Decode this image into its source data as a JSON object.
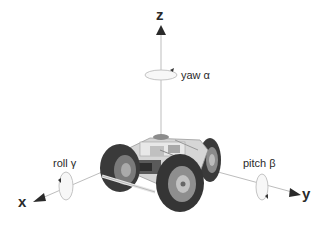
{
  "diagram": {
    "axes": {
      "z": {
        "label": "z"
      },
      "x": {
        "label": "x"
      },
      "y": {
        "label": "y"
      }
    },
    "rotations": {
      "yaw": {
        "label": "yaw α",
        "axis": "z"
      },
      "roll": {
        "label": "roll γ",
        "axis": "x"
      },
      "pitch": {
        "label": "pitch β",
        "axis": "y"
      }
    },
    "colors": {
      "axis_line": "#b8b8b8",
      "arrowhead": "#2a2a2a",
      "rotation_ellipse": "#c8c8c8",
      "tire": "#3a3a3a",
      "chassis": "#d8d8d8",
      "background": "#ffffff"
    }
  }
}
